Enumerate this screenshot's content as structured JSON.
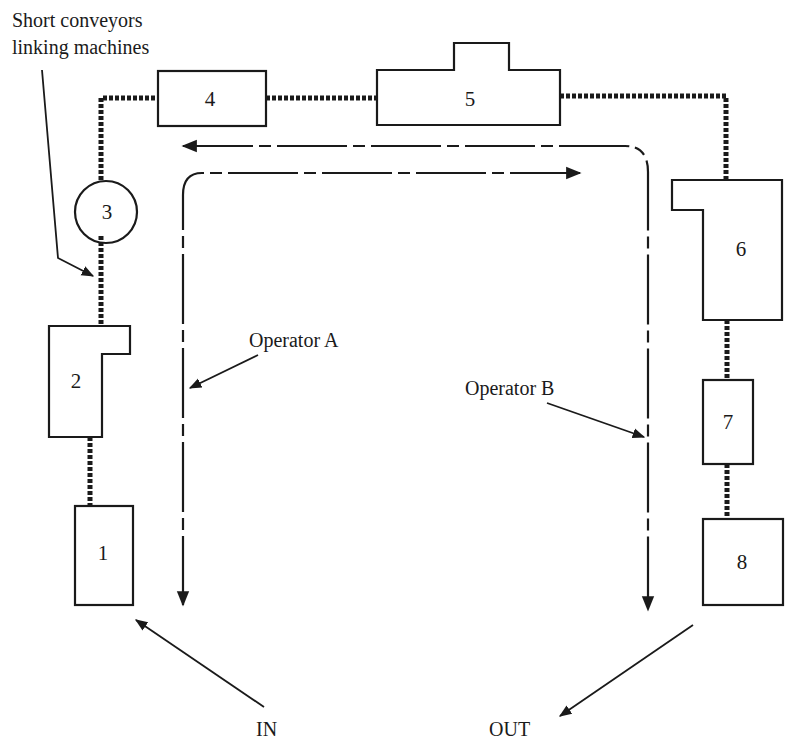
{
  "diagram": {
    "title_note": {
      "line1": "Short conveyors",
      "line2": "linking machines"
    },
    "machines": [
      {
        "id": "1",
        "label": "1"
      },
      {
        "id": "2",
        "label": "2"
      },
      {
        "id": "3",
        "label": "3"
      },
      {
        "id": "4",
        "label": "4"
      },
      {
        "id": "5",
        "label": "5"
      },
      {
        "id": "6",
        "label": "6"
      },
      {
        "id": "7",
        "label": "7"
      },
      {
        "id": "8",
        "label": "8"
      }
    ],
    "operators": [
      {
        "label": "Operator A"
      },
      {
        "label": "Operator B"
      }
    ],
    "flow": {
      "in_label": "IN",
      "out_label": "OUT"
    },
    "colors": {
      "ink": "#1a1a1a",
      "background": "#ffffff"
    }
  }
}
